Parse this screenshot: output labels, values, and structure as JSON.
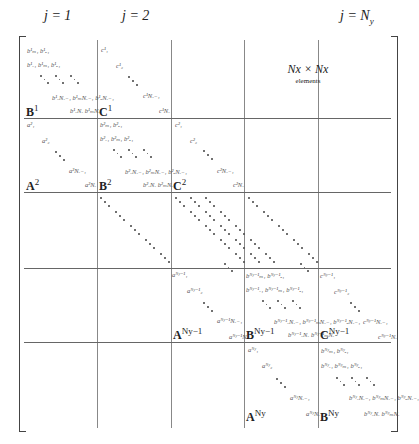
{
  "headers": [
    {
      "text": "j = 1",
      "x": 48
    },
    {
      "text": "j = 2",
      "x": 121
    },
    {
      "text": "j = N",
      "sub": "y",
      "x": 340
    }
  ],
  "note": {
    "title": "Nx × Nx",
    "subtitle": "elements"
  },
  "block_labels": {
    "B1": "B",
    "B1_sup": "1",
    "C1": "C",
    "C1_sup": "1",
    "A2": "A",
    "A2_sup": "2",
    "B2": "B",
    "B2_sup": "2",
    "C2": "C",
    "C2_sup": "2",
    "ANy1": "A",
    "ANy1_sup": "Ny−1",
    "BNy1": "B",
    "BNy1_sup": "Ny−1",
    "CNy1": "C",
    "CNy1_sup": "Ny−1",
    "ANy": "A",
    "ANy_sup": "Ny",
    "BNy": "B",
    "BNy_sup": "Ny"
  },
  "elements": {
    "b1_row1": "b¹ₘ₁  b¹ₑ₁",
    "b1_row2": "b¹ₓ₁  b¹ₘ₁  b¹ₑ₁",
    "b1_row3": "b¹ₓNₓ₋₁ b¹ₘNₓ₋₁ b¹ₑNₓ₋₁",
    "b1_row4": "b¹ₓNₓ  b¹ₘNₓ",
    "c1_1": "c¹₁",
    "c1_2": "c¹₂",
    "c1_3": "c¹Nₓ₋₁",
    "c1_4": "c¹Nₓ",
    "a2_1": "a²₁",
    "a2_2": "a²₂",
    "a2_3": "a²Nₓ₋₁",
    "a2_4": "a²Nₓ",
    "b2_row1": "b²ₘ₁  b²ₑ₁",
    "b2_row2": "b²ₓ₁  b²ₘ₁  b²ₑ₁",
    "b2_row3": "b²ₓNₓ₋₁ b²ₘNₓ₋₁ b²ₑNₓ₋₁",
    "b2_row4": "b²ₓNₓ  b²ₘNₓ",
    "c2_1": "c²₁",
    "c2_2": "c²₂",
    "c2_3": "c²Nₓ₋₁",
    "c2_4": "c²Nₓ",
    "aNy1_1": "aᴺʸ⁻¹₁",
    "aNy1_2": "aᴺʸ⁻¹₂",
    "aNy1_3": "aᴺʸ⁻¹Nₓ₋₁",
    "aNy1_4": "aᴺʸ⁻¹Nₓ",
    "bNy1_row1": "bᴺʸ⁻¹ₘ₁ bᴺʸ⁻¹ₑ₁",
    "bNy1_row2": "bᴺʸ⁻¹ₓ₁ bᴺʸ⁻¹ₘ₁ bᴺʸ⁻¹ₑ₁",
    "bNy1_row3": "bᴺʸ⁻¹ₓNₓ₋₁ bᴺʸ⁻¹ₘNₓ₋₁ bᴺʸ⁻¹ₑNₓ₋₁",
    "bNy1_row4": "bᴺʸ⁻¹ₓNₓ bᴺʸ⁻¹ₘNₓ",
    "cNy1_1": "cᴺʸ⁻¹₁",
    "cNy1_2": "cᴺʸ⁻¹₂",
    "cNy1_3": "cᴺʸ⁻¹Nₓ₋₁",
    "cNy1_4": "cᴺʸ⁻¹Nₓ",
    "aNy_1": "aᴺʸ₁",
    "aNy_2": "aᴺʸ₂",
    "aNy_3": "aᴺʸNₓ₋₁",
    "aNy_4": "aᴺʸNₓ",
    "bNy_row1": "bᴺʸₘ₁ bᴺʸₑ₁",
    "bNy_row2": "bᴺʸₓ₁ bᴺʸₘ₁ bᴺʸₑ₁",
    "bNy_row3": "bᴺʸₓNₓ₋₁ bᴺʸₘNₓ₋₁ bᴺʸₑNₓ₋₁",
    "bNy_row4": "bᴺʸₓNₓ bᴺʸₘNₓ"
  }
}
